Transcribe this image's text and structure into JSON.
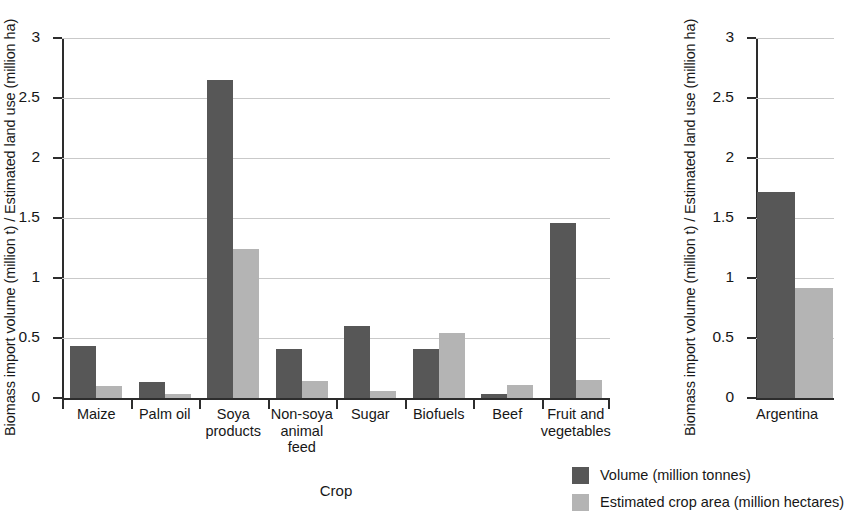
{
  "chart_data": {
    "type": "bar",
    "title": "",
    "panels": [
      {
        "id": "crops",
        "xlabel": "Crop",
        "ylabel": "Biomass import volume (million t) / Estimated land use (million ha)",
        "ylim": [
          0,
          3
        ],
        "yticks": [
          "0",
          "0.5",
          "1",
          "1.5",
          "2",
          "2.5",
          "3"
        ],
        "ytick_values": [
          0,
          0.5,
          1,
          1.5,
          2,
          2.5,
          3
        ],
        "categories": [
          "Maize",
          "Palm oil",
          "Soya products",
          "Non-soya animal feed",
          "Sugar",
          "Biofuels",
          "Beef",
          "Fruit and vegetables"
        ],
        "category_lines": [
          [
            "Maize"
          ],
          [
            "Palm oil"
          ],
          [
            "Soya",
            "products"
          ],
          [
            "Non-soya",
            "animal",
            "feed"
          ],
          [
            "Sugar"
          ],
          [
            "Biofuels"
          ],
          [
            "Beef"
          ],
          [
            "Fruit and",
            "vegetables"
          ]
        ],
        "series": [
          {
            "name": "Volume (million tonnes)",
            "color": "#575757",
            "values": [
              0.43,
              0.13,
              2.65,
              0.41,
              0.6,
              0.41,
              0.03,
              1.46
            ]
          },
          {
            "name": "Estimated crop area (million hectares)",
            "color": "#b4b4b4",
            "values": [
              0.1,
              0.03,
              1.24,
              0.14,
              0.06,
              0.54,
              0.11,
              0.15
            ]
          }
        ]
      },
      {
        "id": "country",
        "xlabel": "",
        "ylabel": "Biomass import volume (million t) / Estimated land use (million ha)",
        "ylim": [
          0,
          3
        ],
        "yticks": [
          "0",
          "0.5",
          "1",
          "1.5",
          "2",
          "2.5",
          "3"
        ],
        "ytick_values": [
          0,
          0.5,
          1,
          1.5,
          2,
          2.5,
          3
        ],
        "categories": [
          "Argentina"
        ],
        "category_lines": [
          [
            "Argentina"
          ]
        ],
        "series": [
          {
            "name": "Volume (million tonnes)",
            "color": "#575757",
            "values": [
              1.72
            ]
          },
          {
            "name": "Estimated crop area (million hectares)",
            "color": "#b4b4b4",
            "values": [
              0.92
            ]
          }
        ]
      }
    ],
    "legend": {
      "position": "bottom-right",
      "entries": [
        {
          "label": "Volume (million tonnes)",
          "color": "#575757"
        },
        {
          "label": "Estimated crop area (million hectares)",
          "color": "#b4b4b4"
        }
      ]
    },
    "grid": {
      "horizontal": true,
      "vertical": false,
      "color": "#c9c9c9"
    }
  },
  "colors": {
    "volume": "#575757",
    "crop_area": "#b4b4b4",
    "axis": "#2d2d2d",
    "grid": "#c9c9c9",
    "text": "#171717",
    "background": "#ffffff"
  }
}
